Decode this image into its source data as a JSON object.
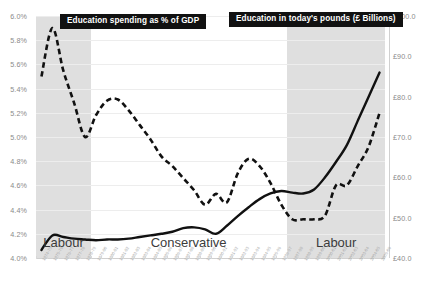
{
  "chart_data": {
    "type": "line",
    "title": "",
    "xlabel": "",
    "legend_position": "inside-top",
    "grid": true,
    "axes": {
      "left": {
        "label": "Education spending as % of GDP",
        "ticks": [
          "4.0%",
          "4.2%",
          "4.4%",
          "4.6%",
          "4.8%",
          "5.0%",
          "5.2%",
          "5.4%",
          "5.6%",
          "5.8%",
          "6.0%"
        ],
        "ylim": [
          4.0,
          6.0
        ],
        "step": 0.2
      },
      "right": {
        "label": "Education in today's pounds (£ Billions)",
        "ticks": [
          "£40.0",
          "£50.0",
          "£60.0",
          "£70.0",
          "£80.0",
          "£90.0",
          "£100.0"
        ],
        "ylim": [
          40.0,
          100.0
        ],
        "step": 10.0
      }
    },
    "categories": [
      "1974-75",
      "1975-76",
      "1976-77",
      "1977-78",
      "1978-79",
      "1979-80",
      "1980-81",
      "1981-82",
      "1982-83",
      "1983-84",
      "1984-85",
      "1985-86",
      "1986-87",
      "1987-88",
      "1988-89",
      "1989-90",
      "1990-91",
      "1991-92",
      "1992-93",
      "1993-94",
      "1994-95",
      "1995-96",
      "1996-97",
      "1997-98",
      "1998-99",
      "1999-00",
      "2000-01",
      "2001-02",
      "2002-03",
      "2003-04",
      "2004-05",
      "2005-06"
    ],
    "series": [
      {
        "name": "Education spending as % of GDP",
        "axis": "left",
        "style": "dashed",
        "color": "#111111",
        "unit": "%",
        "values": [
          5.5,
          5.9,
          5.55,
          5.28,
          5.0,
          5.18,
          5.3,
          5.31,
          5.22,
          5.1,
          4.98,
          4.84,
          4.76,
          4.66,
          4.56,
          4.44,
          4.53,
          4.46,
          4.7,
          4.82,
          4.76,
          4.62,
          4.44,
          4.32,
          4.32,
          4.32,
          4.35,
          4.6,
          4.6,
          4.76,
          4.92,
          5.2
        ]
      },
      {
        "name": "Education in today's pounds (£ Billions)",
        "axis": "right",
        "style": "solid",
        "color": "#111111",
        "unit": "£bn",
        "values": [
          42.0,
          45.6,
          45.2,
          44.8,
          44.6,
          44.4,
          44.6,
          44.6,
          44.8,
          45.2,
          45.6,
          46.0,
          46.5,
          47.4,
          47.6,
          47.1,
          46.0,
          48.0,
          50.4,
          52.6,
          54.6,
          56.0,
          56.6,
          56.2,
          56.0,
          57.0,
          60.0,
          63.8,
          68.0,
          74.0,
          80.0,
          86.0
        ]
      }
    ],
    "bands": [
      {
        "label": "Labour",
        "start": "1974-75",
        "end": "1978-79",
        "color": "#d9d9d9"
      },
      {
        "label": "Conservative",
        "start": "1979-80",
        "end": "1996-97",
        "color": "#ffffff"
      },
      {
        "label": "Labour",
        "start": "1997-98",
        "end": "2005-06",
        "color": "#d9d9d9"
      }
    ],
    "callouts": [
      {
        "text": "Education spending as % of GDP",
        "bg": "#111111",
        "fg": "#ffffff"
      },
      {
        "text": "Education in today's pounds (£ Billions)",
        "bg": "#111111",
        "fg": "#ffffff"
      }
    ]
  }
}
